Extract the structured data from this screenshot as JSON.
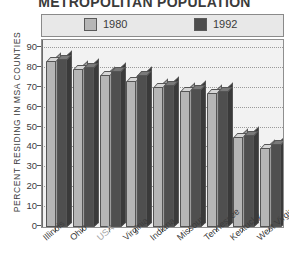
{
  "chart_data": {
    "type": "bar",
    "title": "METROPOLITAN POPULATION",
    "xlabel": "",
    "ylabel": "PERCENT RESIDING IN MSA COUNTIES",
    "ylim": [
      0,
      90
    ],
    "ytick_step": 10,
    "yticks": [
      0,
      10,
      20,
      30,
      40,
      50,
      60,
      70,
      80,
      90
    ],
    "grid": true,
    "legend_position": "top",
    "categories": [
      "Illinois",
      "Ohio",
      "USA",
      "Virginia",
      "Indiana",
      "Missouri",
      "Tennessee",
      "Kentucky",
      "West Virginia"
    ],
    "series": [
      {
        "name": "1980",
        "color": "#b6b6b6",
        "values": [
          83,
          79,
          76,
          73,
          70,
          68,
          67,
          45,
          39
        ]
      },
      {
        "name": "1992",
        "color": "#4f4f4f",
        "values": [
          84,
          80,
          78,
          76,
          71,
          69,
          68,
          46,
          41
        ]
      }
    ]
  },
  "legend": {
    "entries": [
      {
        "label": "1980",
        "swatch": "light-gray-swatch"
      },
      {
        "label": "1992",
        "swatch": "dark-gray-swatch"
      }
    ]
  },
  "axes": {
    "y_title": "PERCENT RESIDING IN MSA COUNTIES",
    "y_tick_labels": [
      "90",
      "80",
      "70",
      "60",
      "50",
      "40",
      "30",
      "20",
      "10",
      "0"
    ]
  },
  "colors": {
    "series_1980": "#b6b6b6",
    "series_1992": "#4f4f4f",
    "plot_background": "#f2f2f2",
    "legend_background": "#e8e8e8",
    "text": "#3c3c3c",
    "muted_label": "#a3a3a3"
  }
}
